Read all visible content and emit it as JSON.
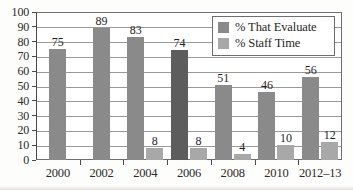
{
  "chart_data": {
    "type": "bar",
    "title": "",
    "subtitle": "",
    "xlabel": "",
    "ylabel": "",
    "categories": [
      "2000",
      "2002",
      "2004",
      "2006",
      "2008",
      "2010",
      "2012–13"
    ],
    "series": [
      {
        "name": "% That Evaluate",
        "color": "#8a8a8a",
        "values": [
          75,
          89,
          83,
          74,
          51,
          46,
          56
        ],
        "point_colors": [
          "#8a8a8a",
          "#8a8a8a",
          "#8a8a8a",
          "#5d5d5d",
          "#8a8a8a",
          "#8a8a8a",
          "#8a8a8a"
        ]
      },
      {
        "name": "% Staff Time",
        "color": "#a8a8a8",
        "values": [
          null,
          null,
          8,
          8,
          4,
          10,
          12
        ]
      }
    ],
    "ylim": [
      0,
      100
    ],
    "yticks": [
      0,
      10,
      20,
      30,
      40,
      50,
      60,
      70,
      80,
      90,
      100
    ],
    "ytick_labels": [
      "0",
      "10",
      "20",
      "30",
      "40",
      "50",
      "60",
      "70",
      "80",
      "90",
      "100"
    ],
    "grid": true,
    "grid_axis": "y",
    "legend_position": "top-right",
    "data_labels": true
  },
  "legend": {
    "items": [
      {
        "label": "% That Evaluate",
        "swatch": "#8a8a8a"
      },
      {
        "label": "% Staff Time",
        "swatch": "#a8a8a8"
      }
    ]
  },
  "colors": {
    "bar_primary": "#8a8a8a",
    "bar_primary_highlight": "#5d5d5d",
    "bar_secondary": "#a8a8a8",
    "grid": "#9a9a9a",
    "axis": "#4a4a4a",
    "text": "#1f1f1f",
    "background": "#ffffff"
  }
}
